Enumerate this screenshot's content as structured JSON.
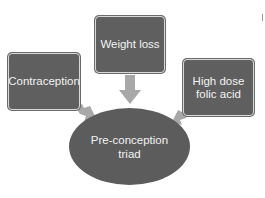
{
  "diagram": {
    "title": "Pre-conception triad",
    "nodes": [
      {
        "id": "weight",
        "label": "Weight loss",
        "shape": "rounded-rect"
      },
      {
        "id": "contraception",
        "label": "Contraception",
        "shape": "rounded-rect"
      },
      {
        "id": "folic",
        "label": "High dose\nfolic acid",
        "shape": "rounded-rect"
      },
      {
        "id": "center",
        "label": "Pre-conception\ntriad",
        "shape": "ellipse"
      }
    ],
    "edges": [
      {
        "from": "weight",
        "to": "center",
        "direction": "down"
      },
      {
        "from": "contraception",
        "to": "center",
        "direction": "down-right"
      },
      {
        "from": "folic",
        "to": "center",
        "direction": "down-left"
      }
    ],
    "colors": {
      "node_fill": "#5f5f5f",
      "node_text": "#f2f2f2",
      "arrow_fill": "#a8a8a8",
      "background": "#ffffff"
    }
  }
}
